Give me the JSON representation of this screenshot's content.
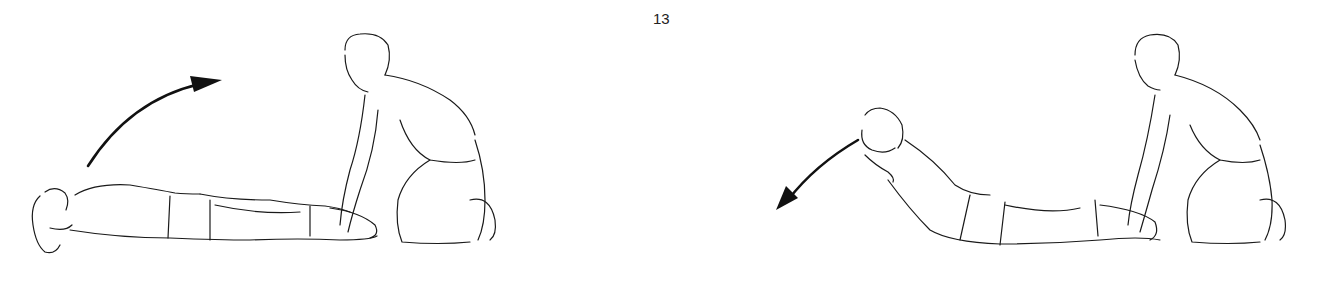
{
  "page": {
    "page_number": "13"
  },
  "figures": [
    {
      "id": "left",
      "description": "Prone person lying face down with hands behind head, partner kneeling and holding ankles; curved arrow pointing up and right (lifting motion)",
      "arrow_direction": "up-right"
    },
    {
      "id": "right",
      "description": "Prone person with chest raised, hands behind head, partner kneeling and holding ankles; curved arrow pointing down and left (lowering motion)",
      "arrow_direction": "down-left"
    }
  ],
  "colors": {
    "background": "#ffffff",
    "ink": "#1a1a1a"
  }
}
